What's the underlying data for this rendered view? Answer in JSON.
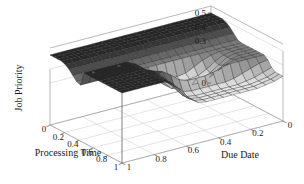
{
  "figure": {
    "background_color": "#ffffff",
    "width": 304,
    "height": 184
  },
  "axes": {
    "z": {
      "title": "Job Priority",
      "ticks": [
        "0.5",
        "0.4",
        "0.3",
        "0"
      ],
      "tick_values": [
        0.5,
        0.4,
        0.3,
        0.0
      ],
      "range": [
        0.0,
        0.55
      ]
    },
    "x": {
      "title": "Processing Time",
      "ticks": [
        "0",
        "0.2",
        "0.4",
        "0.6",
        "0.8",
        "1"
      ],
      "tick_values": [
        0,
        0.2,
        0.4,
        0.6,
        0.8,
        1
      ],
      "range": [
        0,
        1
      ]
    },
    "y": {
      "title": "Due Date",
      "ticks": [
        "1",
        "0.8",
        "0.6",
        "0.4",
        "0.2",
        "0"
      ],
      "tick_values": [
        1,
        0.8,
        0.6,
        0.4,
        0.2,
        0
      ],
      "range": [
        0,
        1
      ]
    }
  },
  "colors": {
    "surface_high": "#2a2a2a",
    "surface_low": "#e2e2e2",
    "surface_mid": "#9a9a9a",
    "mesh": "#222222",
    "axis": "#8a8a8a",
    "text": "#1a1a1a"
  },
  "chart_data": {
    "type": "surface",
    "title": "",
    "xlabel": "Processing Time",
    "ylabel": "Due Date",
    "zlabel": "Job Priority",
    "xlim": [
      0,
      1
    ],
    "ylim": [
      0,
      1
    ],
    "zlim": [
      0.0,
      0.55
    ],
    "grid": true,
    "colormap": "gray",
    "shading": "faceted",
    "view_azimuth": -37.5,
    "view_elevation": 30,
    "x": [
      0,
      0.0526,
      0.1053,
      0.1579,
      0.2105,
      0.2632,
      0.3158,
      0.3684,
      0.4211,
      0.4737,
      0.5263,
      0.5789,
      0.6316,
      0.6842,
      0.7368,
      0.7895,
      0.8421,
      0.8947,
      0.9474,
      1
    ],
    "y": [
      0,
      0.0526,
      0.1053,
      0.1579,
      0.2105,
      0.2632,
      0.3158,
      0.3684,
      0.4211,
      0.4737,
      0.5263,
      0.5789,
      0.6316,
      0.6842,
      0.7368,
      0.7895,
      0.8421,
      0.8947,
      0.9474,
      1
    ],
    "z": [
      [
        0.5,
        0.5,
        0.5,
        0.5,
        0.5,
        0.5,
        0.5,
        0.5,
        0.5,
        0.5,
        0.5,
        0.5,
        0.5,
        0.5,
        0.5,
        0.5,
        0.5,
        0.5,
        0.5,
        0.5
      ],
      [
        0.5,
        0.5,
        0.5,
        0.5,
        0.5,
        0.5,
        0.5,
        0.5,
        0.5,
        0.5,
        0.5,
        0.5,
        0.5,
        0.5,
        0.5,
        0.5,
        0.5,
        0.5,
        0.5,
        0.5
      ],
      [
        0.5,
        0.5,
        0.5,
        0.5,
        0.5,
        0.5,
        0.5,
        0.5,
        0.5,
        0.5,
        0.5,
        0.5,
        0.5,
        0.5,
        0.5,
        0.5,
        0.5,
        0.5,
        0.5,
        0.5
      ],
      [
        0.5,
        0.5,
        0.5,
        0.5,
        0.5,
        0.5,
        0.5,
        0.5,
        0.5,
        0.5,
        0.5,
        0.5,
        0.5,
        0.5,
        0.5,
        0.5,
        0.5,
        0.5,
        0.5,
        0.5
      ],
      [
        0.49,
        0.49,
        0.49,
        0.49,
        0.49,
        0.49,
        0.49,
        0.49,
        0.49,
        0.49,
        0.49,
        0.49,
        0.49,
        0.49,
        0.49,
        0.49,
        0.49,
        0.49,
        0.49,
        0.49
      ],
      [
        0.47,
        0.47,
        0.47,
        0.47,
        0.47,
        0.47,
        0.47,
        0.47,
        0.47,
        0.47,
        0.47,
        0.47,
        0.47,
        0.47,
        0.47,
        0.47,
        0.47,
        0.47,
        0.47,
        0.47
      ],
      [
        0.44,
        0.44,
        0.44,
        0.44,
        0.44,
        0.44,
        0.44,
        0.44,
        0.44,
        0.44,
        0.44,
        0.44,
        0.44,
        0.44,
        0.44,
        0.44,
        0.44,
        0.44,
        0.44,
        0.44
      ],
      [
        0.41,
        0.41,
        0.41,
        0.41,
        0.41,
        0.41,
        0.41,
        0.41,
        0.41,
        0.41,
        0.41,
        0.41,
        0.41,
        0.41,
        0.41,
        0.41,
        0.41,
        0.41,
        0.41,
        0.41
      ],
      [
        0.4,
        0.4,
        0.4,
        0.4,
        0.4,
        0.4,
        0.4,
        0.4,
        0.4,
        0.4,
        0.4,
        0.4,
        0.4,
        0.4,
        0.4,
        0.4,
        0.4,
        0.4,
        0.4,
        0.4
      ],
      [
        0.4,
        0.4,
        0.4,
        0.4,
        0.39,
        0.37,
        0.34,
        0.31,
        0.3,
        0.3,
        0.31,
        0.36,
        0.42,
        0.47,
        0.5,
        0.5,
        0.5,
        0.5,
        0.5,
        0.5
      ],
      [
        0.4,
        0.4,
        0.4,
        0.39,
        0.36,
        0.32,
        0.29,
        0.28,
        0.28,
        0.28,
        0.29,
        0.34,
        0.41,
        0.47,
        0.5,
        0.5,
        0.5,
        0.5,
        0.5,
        0.5
      ],
      [
        0.4,
        0.4,
        0.4,
        0.39,
        0.35,
        0.31,
        0.28,
        0.28,
        0.28,
        0.28,
        0.29,
        0.34,
        0.41,
        0.47,
        0.5,
        0.5,
        0.5,
        0.5,
        0.5,
        0.5
      ],
      [
        0.4,
        0.4,
        0.4,
        0.39,
        0.36,
        0.32,
        0.29,
        0.28,
        0.28,
        0.28,
        0.29,
        0.35,
        0.42,
        0.47,
        0.5,
        0.5,
        0.5,
        0.5,
        0.5,
        0.5
      ],
      [
        0.4,
        0.4,
        0.4,
        0.4,
        0.38,
        0.35,
        0.32,
        0.3,
        0.3,
        0.3,
        0.32,
        0.38,
        0.44,
        0.48,
        0.5,
        0.5,
        0.5,
        0.5,
        0.5,
        0.5
      ],
      [
        0.4,
        0.4,
        0.4,
        0.4,
        0.4,
        0.39,
        0.37,
        0.36,
        0.36,
        0.36,
        0.38,
        0.43,
        0.47,
        0.49,
        0.5,
        0.5,
        0.5,
        0.5,
        0.5,
        0.5
      ],
      [
        0.38,
        0.37,
        0.35,
        0.33,
        0.31,
        0.3,
        0.3,
        0.3,
        0.3,
        0.3,
        0.31,
        0.36,
        0.43,
        0.48,
        0.5,
        0.5,
        0.5,
        0.5,
        0.5,
        0.5
      ],
      [
        0.34,
        0.32,
        0.3,
        0.29,
        0.28,
        0.28,
        0.28,
        0.28,
        0.28,
        0.28,
        0.29,
        0.34,
        0.41,
        0.47,
        0.5,
        0.5,
        0.5,
        0.5,
        0.5,
        0.5
      ],
      [
        0.32,
        0.3,
        0.29,
        0.28,
        0.28,
        0.28,
        0.28,
        0.28,
        0.28,
        0.28,
        0.29,
        0.33,
        0.41,
        0.47,
        0.5,
        0.5,
        0.5,
        0.5,
        0.5,
        0.5
      ],
      [
        0.32,
        0.3,
        0.29,
        0.28,
        0.28,
        0.28,
        0.28,
        0.28,
        0.28,
        0.28,
        0.29,
        0.33,
        0.41,
        0.47,
        0.5,
        0.5,
        0.5,
        0.5,
        0.5,
        0.5
      ],
      [
        0.32,
        0.3,
        0.29,
        0.28,
        0.28,
        0.28,
        0.28,
        0.28,
        0.28,
        0.28,
        0.29,
        0.33,
        0.41,
        0.47,
        0.5,
        0.5,
        0.5,
        0.5,
        0.5,
        0.5
      ]
    ]
  }
}
